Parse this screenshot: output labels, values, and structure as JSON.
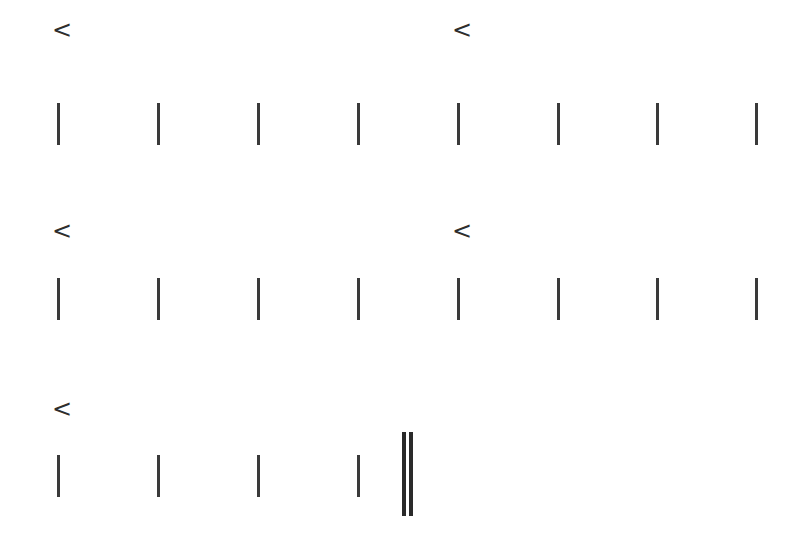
{
  "marker_glyph": "<",
  "stroke_color": "#3a3a3a",
  "rows": [
    {
      "markers": [
        {
          "x": 52,
          "y": 18,
          "label": "<"
        },
        {
          "x": 452,
          "y": 18,
          "label": "<"
        }
      ],
      "bar_top": 103,
      "bar_height": 42,
      "bars_x": [
        57,
        157,
        257,
        357,
        457,
        557,
        656,
        755
      ]
    },
    {
      "markers": [
        {
          "x": 52,
          "y": 219,
          "label": "<"
        },
        {
          "x": 452,
          "y": 219,
          "label": "<"
        }
      ],
      "bar_top": 278,
      "bar_height": 42,
      "bars_x": [
        57,
        157,
        257,
        357,
        457,
        557,
        656,
        755
      ]
    },
    {
      "markers": [
        {
          "x": 52,
          "y": 397,
          "label": "<"
        }
      ],
      "bar_top": 455,
      "bar_height": 42,
      "bars_x": [
        57,
        157,
        257,
        357
      ]
    }
  ],
  "final_barline": {
    "x1": 402,
    "x2": 409,
    "top": 432,
    "height": 84
  }
}
